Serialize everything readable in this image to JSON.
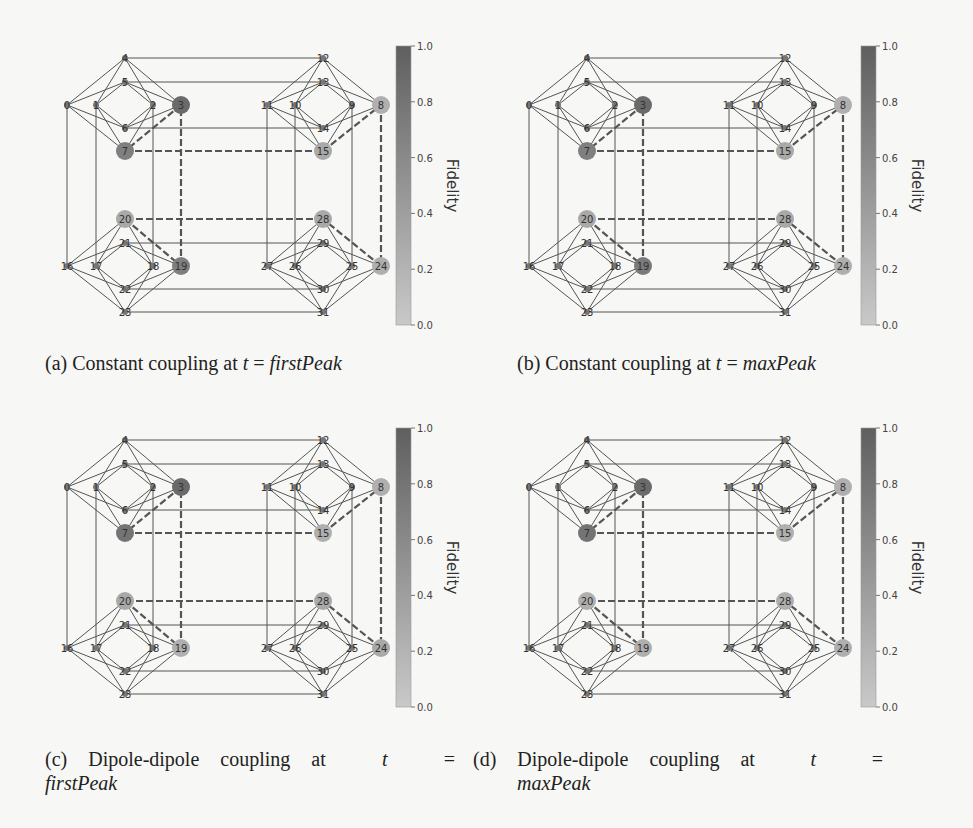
{
  "figure": {
    "colorbar": {
      "label": "Fidelity",
      "ticks": [
        "0.0",
        "0.2",
        "0.4",
        "0.6",
        "0.8",
        "1.0"
      ],
      "color_low": "#c9c9c9",
      "color_high": "#5f5f5f"
    },
    "panels": [
      {
        "id": "a",
        "caption_prefix": "(a) Constant coupling at",
        "caption_var": "t",
        "caption_eq": "=",
        "caption_value": "firstPeak",
        "highlight": {
          "3": 0.9,
          "7": 0.7,
          "8": 0.25,
          "15": 0.3,
          "19": 0.7,
          "20": 0.3,
          "24": 0.25,
          "28": 0.3
        }
      },
      {
        "id": "b",
        "caption_prefix": "(b) Constant coupling at",
        "caption_var": "t",
        "caption_eq": "=",
        "caption_value": "maxPeak",
        "highlight": {
          "3": 0.9,
          "7": 0.7,
          "8": 0.25,
          "15": 0.3,
          "19": 0.75,
          "20": 0.3,
          "24": 0.25,
          "28": 0.3
        }
      },
      {
        "id": "c",
        "caption_prefix": "(c) Dipole-dipole coupling at",
        "caption_var": "t",
        "caption_eq": "=",
        "caption_value": "firstPeak",
        "highlight": {
          "3": 0.9,
          "7": 0.8,
          "8": 0.25,
          "15": 0.25,
          "19": 0.25,
          "20": 0.3,
          "24": 0.3,
          "28": 0.3
        }
      },
      {
        "id": "d",
        "caption_prefix": "(d) Dipole-dipole coupling at",
        "caption_var": "t",
        "caption_eq": "=",
        "caption_value": "maxPeak",
        "highlight": {
          "3": 0.9,
          "7": 0.8,
          "8": 0.25,
          "15": 0.25,
          "19": 0.25,
          "20": 0.25,
          "24": 0.25,
          "28": 0.25
        }
      }
    ]
  },
  "chart_data": {
    "type": "graph",
    "colorbar_label": "Fidelity",
    "colorbar_range": [
      0.0,
      1.0
    ],
    "nodes": 32,
    "cells": [
      [
        0,
        1,
        2,
        3,
        4,
        5,
        6,
        7
      ],
      [
        8,
        9,
        10,
        11,
        12,
        13,
        14,
        15
      ],
      [
        16,
        17,
        18,
        19,
        20,
        21,
        22,
        23
      ],
      [
        24,
        25,
        26,
        27,
        28,
        29,
        30,
        31
      ]
    ],
    "inter_cell_edges": [
      [
        0,
        16
      ],
      [
        1,
        17
      ],
      [
        2,
        18
      ],
      [
        3,
        19
      ],
      [
        4,
        12
      ],
      [
        5,
        13
      ],
      [
        6,
        14
      ],
      [
        7,
        15
      ],
      [
        8,
        24
      ],
      [
        9,
        25
      ],
      [
        10,
        26
      ],
      [
        11,
        27
      ],
      [
        20,
        28
      ],
      [
        21,
        29
      ],
      [
        22,
        30
      ],
      [
        23,
        31
      ]
    ],
    "highlighted_path_edges": [
      [
        3,
        7
      ],
      [
        7,
        15
      ],
      [
        15,
        8
      ],
      [
        8,
        24
      ],
      [
        24,
        28
      ],
      [
        28,
        20
      ],
      [
        20,
        19
      ],
      [
        19,
        3
      ]
    ],
    "panels": [
      {
        "label": "(a) Constant coupling at t = firstPeak",
        "node_fidelity": {
          "3": 0.9,
          "7": 0.7,
          "8": 0.25,
          "15": 0.3,
          "19": 0.7,
          "20": 0.3,
          "24": 0.25,
          "28": 0.3
        }
      },
      {
        "label": "(b) Constant coupling at t = maxPeak",
        "node_fidelity": {
          "3": 0.9,
          "7": 0.7,
          "8": 0.25,
          "15": 0.3,
          "19": 0.75,
          "20": 0.3,
          "24": 0.25,
          "28": 0.3
        }
      },
      {
        "label": "(c) Dipole-dipole coupling at t = firstPeak",
        "node_fidelity": {
          "3": 0.9,
          "7": 0.8,
          "8": 0.25,
          "15": 0.25,
          "19": 0.25,
          "20": 0.3,
          "24": 0.3,
          "28": 0.3
        }
      },
      {
        "label": "(d) Dipole-dipole coupling at t = maxPeak",
        "node_fidelity": {
          "3": 0.9,
          "7": 0.8,
          "8": 0.25,
          "15": 0.25,
          "19": 0.25,
          "20": 0.25,
          "24": 0.25,
          "28": 0.25
        }
      }
    ]
  }
}
